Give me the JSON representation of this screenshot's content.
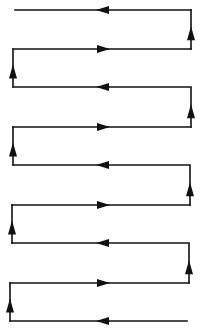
{
  "diagram": {
    "title": "",
    "stroke_color": "#111111",
    "background": "#ffffff",
    "segments": [
      {
        "type": "horizontal",
        "x1": 191,
        "x2": 15,
        "y": 10,
        "arrow": "left"
      },
      {
        "type": "vertical",
        "x": 191,
        "y1": 49,
        "y2": 10,
        "arrow": "up"
      },
      {
        "type": "horizontal",
        "x1": 13,
        "x2": 191,
        "y": 49,
        "arrow": "right"
      },
      {
        "type": "vertical",
        "x": 13,
        "y1": 87,
        "y2": 49,
        "arrow": "up"
      },
      {
        "type": "horizontal",
        "x1": 191,
        "x2": 13,
        "y": 87,
        "arrow": "left"
      },
      {
        "type": "vertical",
        "x": 191,
        "y1": 127,
        "y2": 88,
        "arrow": "up"
      },
      {
        "type": "horizontal",
        "x1": 13,
        "x2": 191,
        "y": 127,
        "arrow": "right"
      },
      {
        "type": "vertical",
        "x": 13,
        "y1": 165,
        "y2": 127,
        "arrow": "up"
      },
      {
        "type": "horizontal",
        "x1": 190,
        "x2": 13,
        "y": 165,
        "arrow": "left"
      },
      {
        "type": "vertical",
        "x": 190,
        "y1": 205,
        "y2": 166,
        "arrow": "up"
      },
      {
        "type": "horizontal",
        "x1": 12,
        "x2": 190,
        "y": 205,
        "arrow": "right"
      },
      {
        "type": "vertical",
        "x": 12,
        "y1": 243,
        "y2": 205,
        "arrow": "up"
      },
      {
        "type": "horizontal",
        "x1": 189,
        "x2": 12,
        "y": 243,
        "arrow": "left"
      },
      {
        "type": "vertical",
        "x": 189,
        "y1": 283,
        "y2": 244,
        "arrow": "up"
      },
      {
        "type": "horizontal",
        "x1": 10,
        "x2": 189,
        "y": 283,
        "arrow": "right"
      },
      {
        "type": "vertical",
        "x": 10,
        "y1": 321,
        "y2": 283,
        "arrow": "up"
      },
      {
        "type": "horizontal",
        "x1": 187,
        "x2": 10,
        "y": 321,
        "arrow": "left"
      }
    ]
  }
}
